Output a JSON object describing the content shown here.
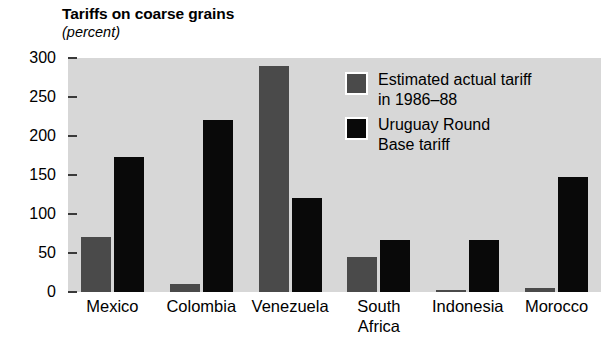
{
  "chart_data": {
    "type": "bar",
    "title": "Tariffs on coarse grains",
    "subtitle": "(percent)",
    "xlabel": "",
    "ylabel": "percent",
    "ylim": [
      0,
      300
    ],
    "yticks": [
      0,
      50,
      100,
      150,
      200,
      250,
      300
    ],
    "ytick_labels": [
      "0",
      "50",
      "100",
      "150",
      "200",
      "250",
      "300"
    ],
    "grid": false,
    "legend_position": "inside upper right",
    "categories": [
      "Mexico",
      "Colombia",
      "Venezuela",
      "South Africa",
      "Indonesia",
      "Morocco"
    ],
    "series": [
      {
        "name": "Estimated actual tariff\nin 1986–88",
        "color": "#4a4a4a",
        "values": [
          70,
          10,
          290,
          45,
          3,
          5
        ]
      },
      {
        "name": "Uruguay Round\nBase tariff",
        "color": "#090909",
        "values": [
          173,
          220,
          121,
          67,
          67,
          147
        ]
      }
    ]
  },
  "header": {
    "title": "Tariffs on coarse grains",
    "subtitle": "(percent)"
  },
  "axis": {
    "y_ticks": [
      {
        "label": "300",
        "value": 300
      },
      {
        "label": "250",
        "value": 250
      },
      {
        "label": "200",
        "value": 200
      },
      {
        "label": "150",
        "value": 150
      },
      {
        "label": "100",
        "value": 100
      },
      {
        "label": "50",
        "value": 50
      },
      {
        "label": "0",
        "value": 0
      }
    ],
    "x_categories": [
      {
        "label": "Mexico"
      },
      {
        "label": "Colombia"
      },
      {
        "label": "Venezuela"
      },
      {
        "label": "South\nAfrica"
      },
      {
        "label": "Indonesia"
      },
      {
        "label": "Morocco"
      }
    ]
  },
  "legend": {
    "items": [
      {
        "label": "Estimated actual tariff\nin 1986–88",
        "color": "#4a4a4a"
      },
      {
        "label": "Uruguay Round\nBase tariff",
        "color": "#090909"
      }
    ]
  },
  "colors": {
    "plot_background": "#d7d7d7",
    "page_background": "#ffffff",
    "series_actual": "#4a4a4a",
    "series_base": "#090909",
    "tick_mark": "#3a3a3a",
    "text": "#000000"
  }
}
